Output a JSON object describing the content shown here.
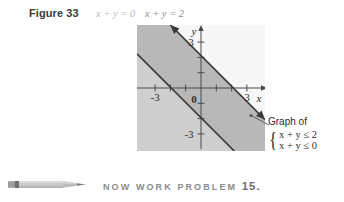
{
  "figure": {
    "label": "Figure 33",
    "equations": [
      {
        "text": "x + y = 0",
        "color": "#bdbdbd"
      },
      {
        "text": "x + y = 2",
        "color": "#8e8e8e"
      }
    ]
  },
  "plot": {
    "axis_labels": {
      "x": "x",
      "y": "y"
    },
    "x_ticks": [
      {
        "value": -3,
        "label": "-3"
      },
      {
        "value": -2,
        "label": ""
      },
      {
        "value": -1,
        "label": ""
      },
      {
        "value": 0,
        "label": "0"
      },
      {
        "value": 1,
        "label": ""
      },
      {
        "value": 2,
        "label": ""
      },
      {
        "value": 3,
        "label": "3"
      }
    ],
    "y_ticks": [
      {
        "value": 3,
        "label": "3"
      },
      {
        "value": 2,
        "label": ""
      },
      {
        "value": 1,
        "label": ""
      },
      {
        "value": -1,
        "label": ""
      },
      {
        "value": -2,
        "label": ""
      },
      {
        "value": -3,
        "label": "-3"
      }
    ],
    "xlim": [
      -4.2,
      4.2
    ],
    "ylim": [
      -4.2,
      4.2
    ],
    "lines": [
      {
        "name": "x + y = 2",
        "equation": "x + y = 2",
        "slope": -1,
        "intercept": 2,
        "style": "solid"
      },
      {
        "name": "x + y = 0",
        "equation": "x + y = 0",
        "slope": -1,
        "intercept": 0,
        "style": "solid"
      }
    ],
    "regions": [
      {
        "name": "outside-upper",
        "description": "x + y > 2",
        "color": "#f6f6f6"
      },
      {
        "name": "band",
        "description": "0 <= x + y <= 2",
        "color": "#b5b5b5"
      },
      {
        "name": "solution-lower",
        "description": "x + y <= 0",
        "color": "#cfcfcf"
      }
    ],
    "background_color": "#d9d9d9"
  },
  "annotation": {
    "title": "Graph of",
    "inequalities": [
      "x + y ≤ 2",
      "x + y ≤ 0"
    ],
    "brace": "{"
  },
  "footer": {
    "icon": "pencil-icon",
    "text": "NOW WORK PROBLEM",
    "problem_number": "15."
  }
}
